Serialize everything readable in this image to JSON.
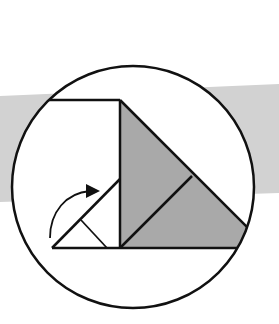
{
  "diagram": {
    "type": "origami-fold-step",
    "colors": {
      "background": "#ffffff",
      "band": "#d2d2d2",
      "shaded": "#a9a9a9",
      "stroke": "#111111",
      "paper": "#ffffff"
    },
    "elements": {
      "detail_circle": {
        "cx": 133,
        "cy": 187,
        "r": 121
      },
      "band": {
        "points": "0,96 279,84 279,193 0,202"
      },
      "paper_top_edge": {
        "x1": 47,
        "y1": 100,
        "x2": 120,
        "y2": 100
      },
      "center_crease": {
        "x1": 120,
        "y1": 100,
        "x2": 120,
        "y2": 248
      },
      "bottom_edge": {
        "x1": 52,
        "y1": 248,
        "x2": 238,
        "y2": 248
      },
      "shaded_triangle": {
        "points": "120,100 247,228 238,248 120,248"
      },
      "inner_diagonal": {
        "x1": 120,
        "y1": 248,
        "x2": 192,
        "y2": 176
      },
      "small_fold_diagonal": {
        "x1": 52,
        "y1": 248,
        "x2": 120,
        "y2": 179
      },
      "small_fold_crease": {
        "x1": 81,
        "y1": 220,
        "x2": 107,
        "y2": 248
      },
      "fold_arrow": {
        "path": "M50,238 C50,212 66,193 92,191",
        "head": "86,184 100,191 86,198"
      }
    }
  }
}
